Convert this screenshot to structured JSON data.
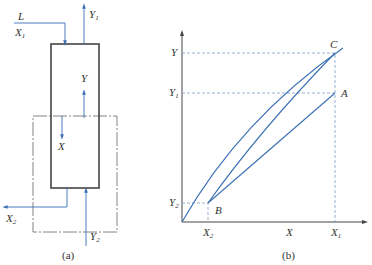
{
  "panel_a": {
    "caption": "(a)",
    "labels": {
      "L": "L",
      "X1_main": "X",
      "X1_sub": "1",
      "Y1_main": "Y",
      "Y1_sub": "1",
      "Y": "Y",
      "X": "X",
      "X2_main": "X",
      "X2_sub": "2",
      "Y2_main": "Y",
      "Y2_sub": "2"
    }
  },
  "panel_b": {
    "caption": "(b)",
    "y_axis_labels": {
      "Y": "Y",
      "Y1_main": "Y",
      "Y1_sub": "1",
      "Y2_main": "Y",
      "Y2_sub": "2"
    },
    "x_axis_labels": {
      "X2_main": "X",
      "X2_sub": "2",
      "X": "X",
      "X1_main": "X",
      "X1_sub": "1"
    },
    "points": {
      "A": "A",
      "B": "B",
      "C": "C"
    }
  },
  "colors": {
    "line_blue": "#3a6fb3",
    "frame": "#444444"
  }
}
